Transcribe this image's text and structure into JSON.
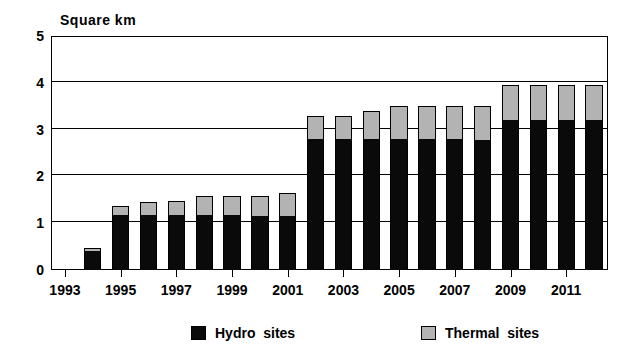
{
  "chart_data": {
    "type": "bar",
    "subtype": "stacked-vertical",
    "title": "",
    "ylabel": "Square km",
    "xlabel": "",
    "ylim": [
      0,
      5
    ],
    "ytick_values": [
      0,
      1,
      2,
      3,
      4,
      5
    ],
    "ytick_labels": [
      "0",
      "1",
      "2",
      "3",
      "4",
      "5"
    ],
    "grid": "horizontal",
    "legend_position": "bottom",
    "x": [
      1993,
      1994,
      1995,
      1996,
      1997,
      1998,
      1999,
      2000,
      2001,
      2002,
      2003,
      2004,
      2005,
      2006,
      2007,
      2008,
      2009,
      2010,
      2011,
      2012
    ],
    "xtick_labels": [
      "1993",
      "",
      "1995",
      "",
      "1997",
      "",
      "1999",
      "",
      "2001",
      "",
      "2003",
      "",
      "2005",
      "",
      "2007",
      "",
      "2009",
      "",
      "2011",
      ""
    ],
    "series": [
      {
        "name": "Hydro sites",
        "color": "#0a0a0a",
        "values": [
          0,
          0.4,
          1.17,
          1.17,
          1.17,
          1.17,
          1.17,
          1.15,
          1.15,
          2.8,
          2.8,
          2.8,
          2.8,
          2.8,
          2.8,
          2.78,
          3.2,
          3.2,
          3.2,
          3.2
        ]
      },
      {
        "name": "Thermal sites",
        "color": "#b3b3b3",
        "values": [
          0,
          0.07,
          0.2,
          0.28,
          0.3,
          0.42,
          0.42,
          0.43,
          0.5,
          0.5,
          0.5,
          0.6,
          0.7,
          0.7,
          0.7,
          0.72,
          0.75,
          0.76,
          0.76,
          0.76
        ]
      }
    ],
    "totals": [
      0,
      0.47,
      1.37,
      1.45,
      1.47,
      1.59,
      1.59,
      1.58,
      1.65,
      3.3,
      3.3,
      3.4,
      3.5,
      3.5,
      3.5,
      3.5,
      3.95,
      3.96,
      3.96,
      3.96
    ]
  },
  "legend": {
    "items": [
      {
        "label": "Hydro  sites",
        "swatch": "hydro"
      },
      {
        "label": "Thermal  sites",
        "swatch": "thermal"
      }
    ]
  }
}
